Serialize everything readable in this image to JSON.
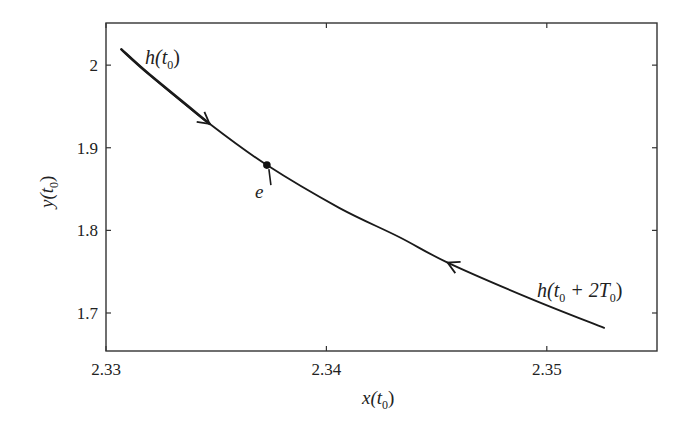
{
  "chart_data": {
    "type": "line",
    "title": "",
    "xlabel": "x(t0)",
    "ylabel": "y(t0)",
    "xlim": [
      2.33,
      2.355
    ],
    "ylim": [
      1.654,
      2.051
    ],
    "grid": false,
    "legend": null,
    "x_ticks": [
      {
        "value": 2.33,
        "label": "2.33"
      },
      {
        "value": 2.34,
        "label": "2.34"
      },
      {
        "value": 2.35,
        "label": "2.35"
      }
    ],
    "y_ticks": [
      {
        "value": 2.0,
        "label": "2"
      },
      {
        "value": 1.9,
        "label": "1.9"
      },
      {
        "value": 1.8,
        "label": "1.8"
      },
      {
        "value": 1.7,
        "label": "1.7"
      }
    ],
    "series": [
      {
        "name": "trajectory",
        "color": "#1a1a1a",
        "x": [
          2.3307,
          2.332,
          2.3347,
          2.3373,
          2.3406,
          2.3433,
          2.3455,
          2.3492,
          2.3526
        ],
        "y": [
          2.019,
          1.988,
          1.929,
          1.879,
          1.827,
          1.792,
          1.761,
          1.718,
          1.682
        ]
      }
    ],
    "annotations": [
      {
        "type": "label",
        "text_main": "h(t",
        "sub": "0",
        "text_tail": ")",
        "x": 2.3318,
        "y": 2.012
      },
      {
        "type": "label",
        "text_main": "h(t",
        "sub": "0",
        "text_tail": " + 2T",
        "sub2": "0",
        "tail2": ")",
        "x": 2.3495,
        "y": 1.73
      },
      {
        "type": "point",
        "name": "e",
        "x": 2.3373,
        "y": 1.879
      },
      {
        "type": "arrow",
        "direction": "forward",
        "x": 2.3347,
        "y": 1.929
      },
      {
        "type": "arrow",
        "direction": "backward",
        "x": 2.3455,
        "y": 1.761
      }
    ]
  },
  "labels": {
    "x_axis": {
      "main": "x(t",
      "sub": "0",
      "tail": ")"
    },
    "y_axis": {
      "main": "y(t",
      "sub": "0",
      "tail": ")"
    },
    "h_start": {
      "main": "h(t",
      "sub": "0",
      "tail": ")"
    },
    "h_end": {
      "main": "h(t",
      "sub": "0",
      "mid": " + 2T",
      "sub2": "0",
      "tail": ")"
    },
    "point_e": "e"
  }
}
